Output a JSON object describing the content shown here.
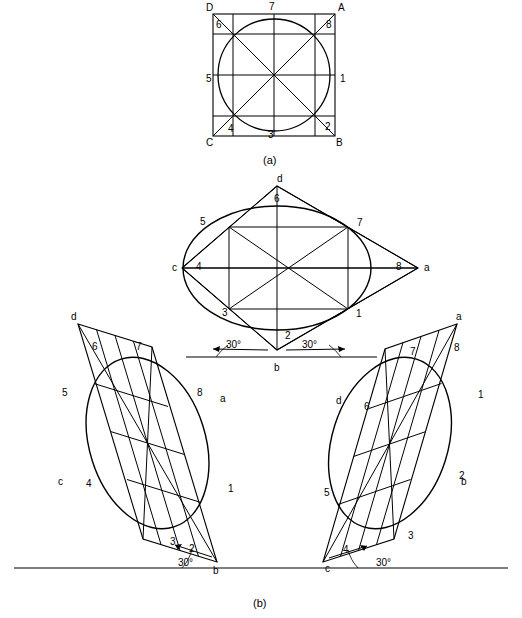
{
  "figure": {
    "caption_a": "(a)",
    "caption_b": "(b)",
    "angle_label": "30°"
  },
  "part_a": {
    "corner_labels": [
      {
        "text": "D",
        "x": 206,
        "y": 6
      },
      {
        "text": "A",
        "x": 340,
        "y": 6
      },
      {
        "text": "C",
        "x": 206,
        "y": 142
      },
      {
        "text": "B",
        "x": 336,
        "y": 142
      }
    ],
    "point_labels": [
      {
        "text": "7",
        "x": 268,
        "y": 6
      },
      {
        "text": "6",
        "x": 215,
        "y": 24
      },
      {
        "text": "8",
        "x": 326,
        "y": 24
      },
      {
        "text": "5",
        "x": 208,
        "y": 80
      },
      {
        "text": "1",
        "x": 338,
        "y": 80
      },
      {
        "text": "4",
        "x": 228,
        "y": 130
      },
      {
        "text": "3",
        "x": 268,
        "y": 136
      },
      {
        "text": "2",
        "x": 325,
        "y": 128
      }
    ]
  },
  "part_b": {
    "top_view": {
      "corner_labels": [
        {
          "text": "d",
          "x": 279,
          "y": 179
        },
        {
          "text": "c",
          "x": 176,
          "y": 263
        },
        {
          "text": "a",
          "x": 424,
          "y": 263
        },
        {
          "text": "b",
          "x": 277,
          "y": 366
        }
      ],
      "point_labels": [
        {
          "text": "6",
          "x": 275,
          "y": 199
        },
        {
          "text": "5",
          "x": 201,
          "y": 222
        },
        {
          "text": "7",
          "x": 357,
          "y": 223
        },
        {
          "text": "4",
          "x": 196,
          "y": 264
        },
        {
          "text": "8",
          "x": 396,
          "y": 264
        },
        {
          "text": "3",
          "x": 224,
          "y": 311
        },
        {
          "text": "2",
          "x": 287,
          "y": 334
        },
        {
          "text": "1",
          "x": 356,
          "y": 313
        }
      ],
      "angles": [
        {
          "text": "30°",
          "x": 229,
          "y": 344
        },
        {
          "text": "30°",
          "x": 305,
          "y": 344
        }
      ]
    },
    "left_view": {
      "corner_labels": [
        {
          "text": "d",
          "x": 71,
          "y": 316
        },
        {
          "text": "a",
          "x": 218,
          "y": 398
        },
        {
          "text": "c",
          "x": 60,
          "y": 480
        },
        {
          "text": "b",
          "x": 213,
          "y": 570
        }
      ],
      "point_labels": [
        {
          "text": "6",
          "x": 93,
          "y": 346
        },
        {
          "text": "7",
          "x": 136,
          "y": 345
        },
        {
          "text": "5",
          "x": 63,
          "y": 390
        },
        {
          "text": "8",
          "x": 197,
          "y": 392
        },
        {
          "text": "4",
          "x": 86,
          "y": 484
        },
        {
          "text": "1",
          "x": 228,
          "y": 488
        },
        {
          "text": "3",
          "x": 172,
          "y": 541
        },
        {
          "text": "2",
          "x": 190,
          "y": 548
        }
      ],
      "angle": {
        "text": "30°",
        "x": 180,
        "y": 563
      }
    },
    "right_view": {
      "corner_labels": [
        {
          "text": "a",
          "x": 456,
          "y": 316
        },
        {
          "text": "d",
          "x": 338,
          "y": 400
        },
        {
          "text": "b",
          "x": 461,
          "y": 480
        },
        {
          "text": "c",
          "x": 327,
          "y": 568
        }
      ],
      "point_labels": [
        {
          "text": "7",
          "x": 411,
          "y": 351
        },
        {
          "text": "8",
          "x": 455,
          "y": 347
        },
        {
          "text": "6",
          "x": 365,
          "y": 406
        },
        {
          "text": "1",
          "x": 478,
          "y": 394
        },
        {
          "text": "5",
          "x": 325,
          "y": 492
        },
        {
          "text": "2",
          "x": 460,
          "y": 475
        },
        {
          "text": "3",
          "x": 409,
          "y": 535
        },
        {
          "text": "4",
          "x": 344,
          "y": 549
        }
      ],
      "angle": {
        "text": "30°",
        "x": 378,
        "y": 563
      }
    }
  },
  "colors": {
    "stroke": "#000000",
    "background": "#ffffff"
  }
}
